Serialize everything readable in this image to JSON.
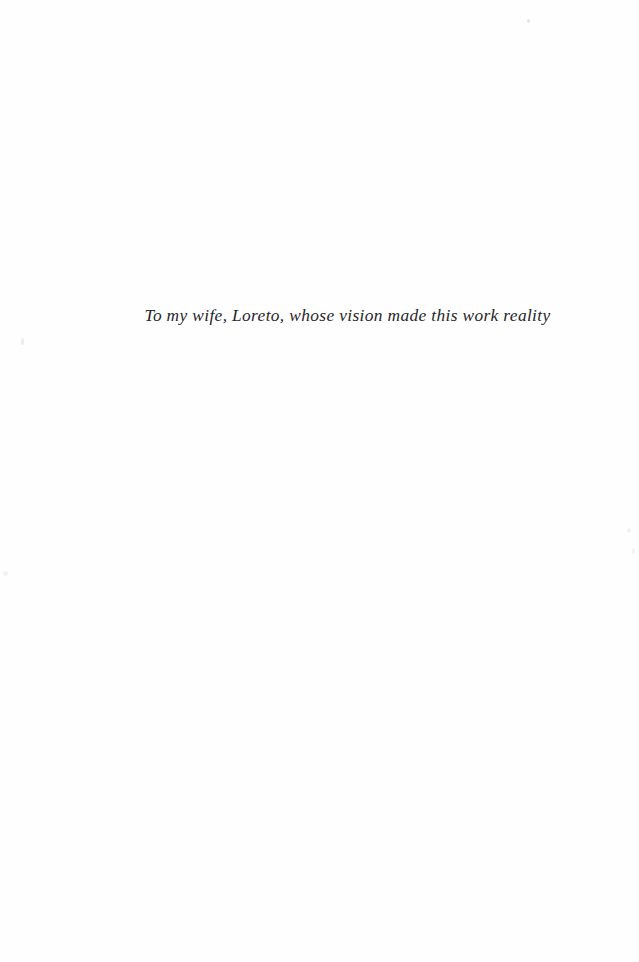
{
  "page": {
    "type": "book-dedication-page",
    "background_color": "#fefefe",
    "width": 639,
    "height": 962
  },
  "dedication": {
    "text": "To my wife, Loreto, whose vision made this work reality",
    "style": "italic-serif",
    "text_color": "#26262b",
    "alignment": "center"
  },
  "artifacts": {
    "speck_color": "#efeff1",
    "count": 5
  }
}
